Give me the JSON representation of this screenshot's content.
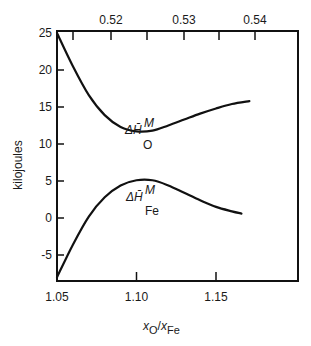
{
  "chart_data": {
    "type": "line",
    "title": "",
    "xlabel": "x_O/x_Fe",
    "xlabel_parts": {
      "x1": "x",
      "sub1": "O",
      "slash": "/",
      "x2": "x",
      "sub2": "Fe"
    },
    "ylabel": "kilojoules",
    "xlim": [
      1.05,
      1.203
    ],
    "ylim": [
      -8.5,
      25
    ],
    "x_ticks": [
      1.05,
      1.1,
      1.15
    ],
    "x_tick_labels": [
      "1.05",
      "1.10",
      "1.15"
    ],
    "y_ticks": [
      25,
      20,
      15,
      10,
      5,
      0,
      -5
    ],
    "y_tick_labels": [
      "25",
      "20",
      "15",
      "10",
      "5",
      "0",
      "-5"
    ],
    "top_axis": {
      "label": "",
      "major_ticks": [
        0.52,
        0.53,
        0.54
      ],
      "major_tick_labels": [
        "0.52",
        "0.53",
        "0.54"
      ],
      "minor_ticks": [
        0.515,
        0.525,
        0.535
      ],
      "tick_pixel_positions": {
        "0.515": 73,
        "0.52": 111,
        "0.525": 147,
        "0.53": 184,
        "0.535": 219,
        "0.54": 255
      }
    },
    "grid": false,
    "legend": "none (inline curve labels)",
    "series": [
      {
        "name": "ΔH̄_O^M",
        "label_main": "ΔH̄",
        "label_sup": "M",
        "label_sub": "O",
        "x": [
          1.05,
          1.06,
          1.07,
          1.08,
          1.09,
          1.1,
          1.11,
          1.12,
          1.13,
          1.14,
          1.15,
          1.16,
          1.171
        ],
        "y": [
          25,
          20.5,
          16.6,
          13.9,
          12.3,
          11.7,
          11.8,
          12.5,
          13.3,
          14.1,
          14.8,
          15.4,
          15.8
        ]
      },
      {
        "name": "ΔH̄_Fe^M",
        "label_main": "ΔH̄",
        "label_sup": "M",
        "label_sub": "Fe",
        "x": [
          1.05,
          1.06,
          1.07,
          1.08,
          1.09,
          1.1,
          1.11,
          1.12,
          1.13,
          1.14,
          1.15,
          1.16,
          1.166
        ],
        "y": [
          -8.0,
          -3.6,
          0.2,
          2.8,
          4.4,
          5.1,
          5.1,
          4.4,
          3.4,
          2.4,
          1.5,
          0.9,
          0.6
        ]
      }
    ]
  },
  "colors": {
    "line": "#111111",
    "background": "#ffffff"
  }
}
